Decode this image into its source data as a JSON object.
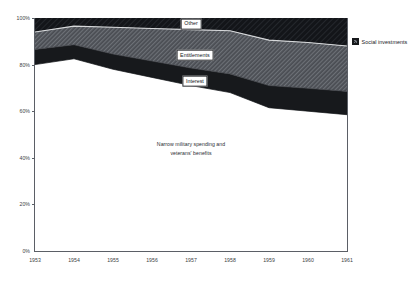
{
  "chart_data": {
    "type": "area",
    "title": "",
    "subtitle": "",
    "xlabel": "",
    "ylabel": "",
    "stacked": true,
    "normalized": true,
    "grid": false,
    "legend_position": "right",
    "xlim": [
      1953,
      1961
    ],
    "ylim": [
      0,
      100
    ],
    "x": [
      1953,
      1954,
      1955,
      1956,
      1957,
      1958,
      1959,
      1960,
      1961
    ],
    "categories": [
      "1953",
      "1954",
      "1955",
      "1956",
      "1957",
      "1958",
      "1959",
      "1960",
      "1961"
    ],
    "y_ticks": [
      0,
      20,
      40,
      60,
      80,
      100
    ],
    "y_tick_labels": [
      "0%",
      "20%",
      "40%",
      "60%",
      "80%",
      "100%"
    ],
    "series": [
      {
        "name": "Narrow military spending and veterans' benefits",
        "fill": "#ffffff",
        "values": [
          80.0,
          82.5,
          78.0,
          74.5,
          71.0,
          68.0,
          61.5,
          60.0,
          58.5
        ]
      },
      {
        "name": "Interest",
        "fill": "#17191c",
        "values": [
          6.5,
          6.0,
          6.5,
          7.0,
          7.5,
          8.0,
          9.5,
          9.8,
          10.0
        ]
      },
      {
        "name": "Entitlements",
        "fill": "#4a4d53",
        "values": [
          7.5,
          8.0,
          11.5,
          14.0,
          16.5,
          18.5,
          19.5,
          19.7,
          19.5
        ]
      },
      {
        "name": "Other",
        "fill": "#131519",
        "values": [
          6.0,
          3.5,
          4.0,
          4.5,
          5.0,
          5.5,
          9.5,
          10.5,
          12.0
        ]
      }
    ],
    "cumulative_boundaries": {
      "military_top": [
        80.0,
        82.5,
        78.0,
        74.5,
        71.0,
        68.0,
        61.5,
        60.0,
        58.5
      ],
      "interest_top": [
        86.5,
        88.5,
        84.5,
        81.5,
        78.5,
        76.0,
        71.0,
        69.8,
        68.5
      ],
      "entitlements_top": [
        94.0,
        96.5,
        96.0,
        95.5,
        95.0,
        94.5,
        90.5,
        89.5,
        88.0
      ],
      "other_top": [
        100,
        100,
        100,
        100,
        100,
        100,
        100,
        100,
        100
      ]
    },
    "annotations": [
      {
        "id": "military-annotation",
        "line1": "Narrow military spending and",
        "line2": "veterans' benefits",
        "x": 1957.0,
        "y": 44
      }
    ],
    "series_callouts": [
      {
        "id": "other",
        "label": "Other",
        "x": 1957.0,
        "y": 97.5
      },
      {
        "id": "entitlements",
        "label": "Entitlements",
        "x": 1957.1,
        "y": 84.0
      },
      {
        "id": "interest",
        "label": "Interest",
        "x": 1957.1,
        "y": 73.0
      }
    ],
    "legend": [
      {
        "id": "social-investments",
        "label": "Social investments",
        "color": "#2b2e33"
      }
    ]
  }
}
